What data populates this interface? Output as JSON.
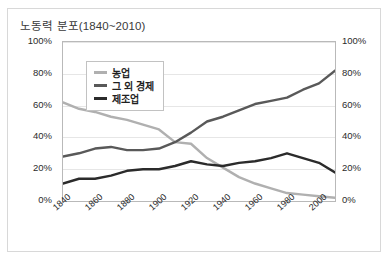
{
  "card": {
    "title": "노동력 분포(1840~2010)"
  },
  "chart_data": {
    "type": "line",
    "title": "노동력 분포(1840~2010)",
    "xlabel": "",
    "ylabel": "",
    "xlim": [
      1840,
      2010
    ],
    "ylim": [
      0,
      100
    ],
    "grid": true,
    "legend_position": "top-left-inside",
    "y_unit": "%",
    "y_ticks": [
      0,
      20,
      40,
      60,
      80,
      100
    ],
    "y_tick_labels_left": [
      "0%",
      "20%",
      "40%",
      "60%",
      "80%",
      "100%"
    ],
    "y_tick_labels_right": [
      "0%",
      "20%",
      "40%",
      "60%",
      "80%",
      "100%"
    ],
    "x_ticks": [
      1840,
      1860,
      1880,
      1900,
      1920,
      1940,
      1960,
      1980,
      2000
    ],
    "x_tick_labels": [
      "1840",
      "1860",
      "1880",
      "1900",
      "1920",
      "1940",
      "1960",
      "1980",
      "2000"
    ],
    "x": [
      1840,
      1850,
      1860,
      1870,
      1880,
      1890,
      1900,
      1910,
      1920,
      1930,
      1940,
      1950,
      1960,
      1970,
      1980,
      1990,
      2000,
      2010
    ],
    "series": [
      {
        "name": "농업",
        "color": "#b0b0b0",
        "values": [
          62,
          58,
          56,
          53,
          51,
          48,
          45,
          37,
          36,
          27,
          21,
          15,
          11,
          8,
          5,
          4,
          3,
          2
        ]
      },
      {
        "name": "그 외 경제",
        "color": "#595959",
        "values": [
          28,
          30,
          33,
          34,
          32,
          32,
          33,
          37,
          43,
          50,
          53,
          57,
          61,
          63,
          65,
          70,
          74,
          82
        ]
      },
      {
        "name": "제조업",
        "color": "#2b2b2b",
        "values": [
          11,
          14,
          14,
          16,
          19,
          20,
          20,
          22,
          25,
          23,
          22,
          24,
          25,
          27,
          30,
          27,
          24,
          18
        ]
      }
    ]
  },
  "legend": {
    "items": [
      {
        "label": "농업"
      },
      {
        "label": "그 외 경제"
      },
      {
        "label": "제조업"
      }
    ]
  },
  "colors": {
    "card_border": "#d8d8d8",
    "plot_border": "#b9b9b9",
    "gridline": "#e6e6e6",
    "background": "#ffffff",
    "text": "#2b2b2b"
  }
}
